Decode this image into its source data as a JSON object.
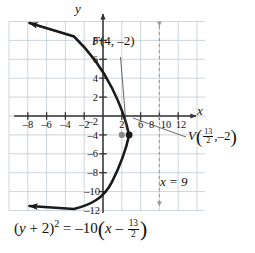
{
  "figure": {
    "kind": "coordinate-graph",
    "axes": {
      "x_name": "x",
      "y_name": "y",
      "x_ticks": [
        -8,
        -6,
        -4,
        -2,
        2,
        6,
        8,
        10,
        12
      ],
      "x_tick_labels": [
        "–8",
        "–6",
        "–4",
        "–2",
        "2",
        "6",
        "8",
        "10",
        "12"
      ],
      "y_ticks": [
        8,
        6,
        4,
        2,
        -2,
        -4,
        -6,
        -8,
        -10,
        -12
      ],
      "y_tick_labels": [
        "8",
        "6",
        "4",
        "2",
        "–2",
        "–4",
        "–6",
        "–8",
        "–10",
        "–12"
      ],
      "xlim": [
        -9,
        14
      ],
      "ylim": [
        -13.5,
        9.5
      ],
      "grid": true,
      "grid_color": "#b9c3cf",
      "axis_color": "#333333"
    },
    "curve": {
      "label": "parabola",
      "equation_latex": "(y + 2)^2 = -10(x - 13/2)",
      "opens": "left",
      "vertex": [
        6.5,
        -2
      ],
      "focus": [
        4,
        -2
      ],
      "directrix_x": 9,
      "four_p": -10,
      "color": "#1a1a1a",
      "arrow_ends": [
        "top-left",
        "bottom-left"
      ],
      "points": [
        [
          6.5,
          -2
        ],
        [
          6.0,
          -4.236
        ],
        [
          5.0,
          -6.873
        ],
        [
          4.0,
          -8.062
        ],
        [
          3.0,
          -9.916
        ],
        [
          2.0,
          -9.0
        ],
        [
          1.0,
          -9.416
        ],
        [
          0.0,
          -10.062
        ],
        [
          -2.0,
          -11.22
        ],
        [
          -4.0,
          -12.247
        ],
        [
          -6.0,
          -13.19
        ],
        [
          6.0,
          0.236
        ],
        [
          5.0,
          1.873
        ],
        [
          4.0,
          3.062
        ],
        [
          3.0,
          4.0
        ],
        [
          2.0,
          4.708
        ],
        [
          1.0,
          5.416
        ],
        [
          0.0,
          6.062
        ],
        [
          -2.0,
          7.22
        ],
        [
          -4.0,
          8.247
        ],
        [
          -6.0,
          9.19
        ]
      ]
    },
    "markers": [
      {
        "name": "focus-point",
        "x": 4,
        "y": -2,
        "color": "#8a8a8a",
        "label": "F"
      },
      {
        "name": "vertex-point",
        "x": 6.5,
        "y": -2,
        "color": "#1a1a1a",
        "label": "V"
      }
    ],
    "directrix": {
      "name": "directrix-line",
      "x": 9,
      "style": "dashed",
      "color": "#9a9a9a",
      "arrow_ends": [
        "top",
        "bottom"
      ]
    }
  },
  "labels": {
    "x_axis_name": "x",
    "y_axis_name": "y",
    "focus": {
      "letter": "F",
      "coords": "(4, –2)",
      "full": "F(4, –2)"
    },
    "vertex": {
      "letter": "V",
      "num": "13",
      "den": "2",
      "comma": ",",
      "second": "–2",
      "full": "V(13/2, –2)"
    },
    "directrix": "x = 9",
    "equation": {
      "lhs_open": "(",
      "lhs_var": "y",
      "lhs_plus": "+ 2",
      "lhs_close": ")",
      "power": "2",
      "equals": "=",
      "rhs_coef": "–10",
      "rhs_open": "(",
      "rhs_var": "x",
      "rhs_minus": "–",
      "frac_num": "13",
      "frac_den": "2",
      "rhs_close": ")",
      "full": "(y + 2)² = –10(x – 13/2)"
    }
  }
}
